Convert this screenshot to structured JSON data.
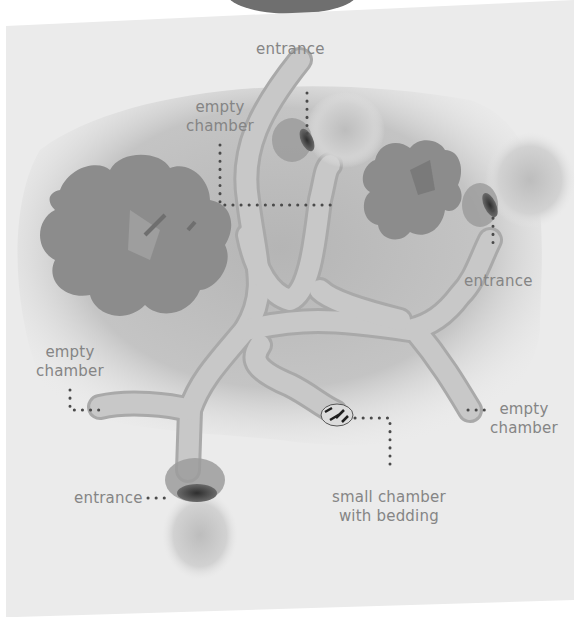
{
  "diagram": {
    "banner_title": "Small Sett",
    "type": "badger sett cross-section (top-down view)",
    "colors": {
      "page_background": "#ffffff",
      "sheet_gray": "#ebebeb",
      "ground_shadow": "#bdbdbd",
      "tunnel_fill": "#c8c8c8",
      "tunnel_edge": "#a9a9a9",
      "bush": "#8a8a8a",
      "label_text": "#858585",
      "leader_dots": "#4a4a4a",
      "banner": "#6f6f6f"
    },
    "labels": [
      {
        "id": "entrance-top",
        "lines": [
          "entrance"
        ]
      },
      {
        "id": "empty-chamber-top",
        "lines": [
          "empty",
          "chamber"
        ]
      },
      {
        "id": "entrance-right",
        "lines": [
          "entrance"
        ]
      },
      {
        "id": "empty-chamber-left",
        "lines": [
          "empty",
          "chamber"
        ]
      },
      {
        "id": "empty-chamber-right",
        "lines": [
          "empty",
          "chamber"
        ]
      },
      {
        "id": "entrance-bottom",
        "lines": [
          "entrance"
        ]
      },
      {
        "id": "bedding-chamber",
        "lines": [
          "small chamber",
          "with bedding"
        ]
      }
    ],
    "features": {
      "entrances": 3,
      "empty_chambers": 3,
      "bedding_chambers": 1,
      "bushes": 2
    }
  }
}
